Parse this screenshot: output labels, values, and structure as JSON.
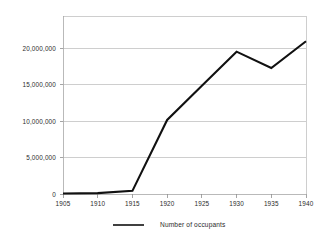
{
  "chart_data": {
    "type": "line",
    "title": "",
    "subtitle": "",
    "xlabel": "",
    "ylabel": "",
    "x": [
      1905,
      1910,
      1915,
      1920,
      1925,
      1930,
      1935,
      1940
    ],
    "categories": [
      "1905",
      "1910",
      "1915",
      "1920",
      "1925",
      "1930",
      "1935",
      "1940"
    ],
    "series": [
      {
        "name": "Number of occupants",
        "color": "#111111",
        "values": [
          100000,
          150000,
          450000,
          10000000,
          14600000,
          19200000,
          17000000,
          20600000
        ]
      }
    ],
    "xlim": [
      1905,
      1940
    ],
    "ylim": [
      0,
      24000000
    ],
    "x_tick_labels": [
      "1905",
      "1910",
      "1915",
      "1920",
      "1925",
      "1930",
      "1935",
      "1940"
    ],
    "y_tick_values": [
      0,
      5000000,
      10000000,
      15000000,
      20000000
    ],
    "y_tick_labels": [
      "0",
      "5,000,000",
      "10,000,000",
      "15,000,000",
      "20,000,000"
    ],
    "grid": true,
    "grid_axis": "y",
    "legend": true,
    "legend_position": "bottom-center",
    "legend_entries": [
      "Number of occupants"
    ],
    "colors": {
      "line": "#111111",
      "grid": "#b9b9b9",
      "axis": "#a8a8a8",
      "text": "#2b2b2b",
      "background": "#ffffff"
    }
  }
}
